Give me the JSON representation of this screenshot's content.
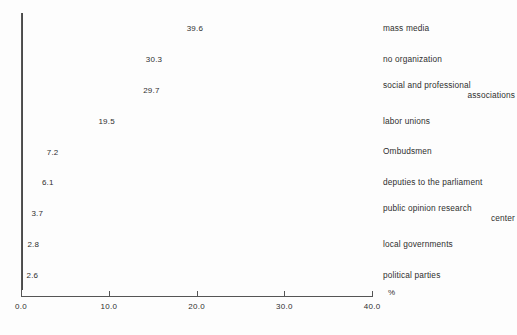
{
  "chart_data": {
    "type": "bar",
    "orientation": "horizontal",
    "title": "",
    "subtitle": "",
    "xlabel": "%",
    "ylabel": "",
    "xlim": [
      0.0,
      40.0
    ],
    "grid": false,
    "legend": null,
    "axis_unit": "%",
    "x_ticks": [
      "0.0",
      "10.0",
      "20.0",
      "30.0",
      "40.0"
    ],
    "x_tick_values": [
      0.0,
      10.0,
      20.0,
      30.0,
      40.0
    ],
    "categories": [
      "mass media",
      "no organization",
      "social and professional associations",
      "labor unions",
      "Ombudsmen",
      "deputies to the parliament",
      "public opinion research center",
      "local governments",
      "political parties"
    ],
    "values": [
      39.6,
      30.3,
      29.7,
      19.5,
      7.2,
      6.1,
      3.7,
      2.8,
      2.6
    ],
    "value_labels": [
      "39.6",
      "30.3",
      "29.7",
      "19.5",
      "7.2",
      "6.1",
      "3.7",
      "2.8",
      "2.6"
    ],
    "bars": [
      {
        "label": "mass media",
        "label_line1": "mass media",
        "label_line2": "",
        "value": 39.6,
        "value_label": "39.6"
      },
      {
        "label": "no organization",
        "label_line1": "no organization",
        "label_line2": "",
        "value": 30.3,
        "value_label": "30.3"
      },
      {
        "label": "social and professional associations",
        "label_line1": "social and professional",
        "label_line2": "associations",
        "value": 29.7,
        "value_label": "29.7"
      },
      {
        "label": "labor unions",
        "label_line1": "labor unions",
        "label_line2": "",
        "value": 19.5,
        "value_label": "19.5"
      },
      {
        "label": "Ombudsmen",
        "label_line1": "Ombudsmen",
        "label_line2": "",
        "value": 7.2,
        "value_label": "7.2"
      },
      {
        "label": "deputies to the parliament",
        "label_line1": "deputies to the parliament",
        "label_line2": "",
        "value": 6.1,
        "value_label": "6.1"
      },
      {
        "label": "public opinion research center",
        "label_line1": "public opinion research",
        "label_line2": "center",
        "value": 3.7,
        "value_label": "3.7"
      },
      {
        "label": "local governments",
        "label_line1": "local governments",
        "label_line2": "",
        "value": 2.8,
        "value_label": "2.8"
      },
      {
        "label": "political parties",
        "label_line1": "political parties",
        "label_line2": "",
        "value": 2.6,
        "value_label": "2.6"
      }
    ],
    "colors": {
      "bar_fill": "#ffffff",
      "bar_border": "#4a4a4a",
      "axis": "#555555",
      "text": "#2f2f2f",
      "background": "#fdfdfd"
    }
  }
}
